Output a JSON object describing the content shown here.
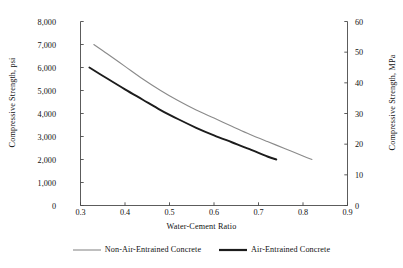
{
  "chart_data": {
    "type": "line",
    "title": "",
    "xlabel": "Water-Cement Ratio",
    "ylabel": "Compressive Strength, psi",
    "ylabel_secondary": "Compressive Strength, MPa",
    "xlim": [
      0.3,
      0.9
    ],
    "ylim": [
      0,
      8000
    ],
    "ylim_secondary": [
      0,
      60
    ],
    "grid": false,
    "legend_position": "below",
    "xticks": [
      "0.3",
      "0.4",
      "0.5",
      "0.6",
      "0.7",
      "0.8",
      "0.9"
    ],
    "xtick_values": [
      0.3,
      0.4,
      0.5,
      0.6,
      0.7,
      0.8,
      0.9
    ],
    "yticks": [
      "0",
      "1,000",
      "2,000",
      "3,000",
      "4,000",
      "5,000",
      "6,000",
      "7,000",
      "8,000"
    ],
    "ytick_values": [
      0,
      1000,
      2000,
      3000,
      4000,
      5000,
      6000,
      7000,
      8000
    ],
    "yticks_secondary": [
      "0",
      "10",
      "20",
      "30",
      "40",
      "50",
      "60"
    ],
    "ytick_values_secondary": [
      0,
      10,
      20,
      30,
      40,
      50,
      60
    ],
    "series": [
      {
        "name": "Non-Air-Entrained Concrete",
        "color": "#8a8a8a",
        "width": 1.1,
        "x": [
          0.33,
          0.36,
          0.4,
          0.44,
          0.48,
          0.52,
          0.56,
          0.6,
          0.64,
          0.68,
          0.72,
          0.76,
          0.8,
          0.82
        ],
        "values": [
          7000,
          6600,
          6050,
          5500,
          5000,
          4550,
          4150,
          3800,
          3450,
          3100,
          2780,
          2470,
          2150,
          2000
        ]
      },
      {
        "name": "Air-Entrained Concrete",
        "color": "#1c1c1c",
        "width": 1.9,
        "x": [
          0.32,
          0.36,
          0.4,
          0.44,
          0.48,
          0.52,
          0.56,
          0.6,
          0.64,
          0.68,
          0.72,
          0.74
        ],
        "values": [
          6000,
          5520,
          5050,
          4600,
          4150,
          3750,
          3380,
          3050,
          2750,
          2450,
          2130,
          2000
        ]
      }
    ]
  },
  "legend": [
    {
      "label": "Non-Air-Entrained Concrete",
      "color": "#8a8a8a",
      "width": 1.1
    },
    {
      "label": "Air-Entrained Concrete",
      "color": "#1c1c1c",
      "width": 2.2
    }
  ]
}
